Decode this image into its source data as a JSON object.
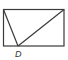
{
  "diagram": {
    "type": "geometry",
    "rectangle": {
      "x": 3.5,
      "y": 9.5,
      "width": 60.5,
      "height": 36.5
    },
    "points": {
      "top_left": {
        "x": 3.5,
        "y": 9.5
      },
      "top_right": {
        "x": 64,
        "y": 9.5
      },
      "D": {
        "x": 18,
        "y": 46
      }
    },
    "segments": [
      {
        "from": "top_left",
        "to": "D"
      },
      {
        "from": "top_right",
        "to": "D"
      }
    ],
    "labels": [
      {
        "text": "D",
        "x": 15,
        "y": 57,
        "point": "D"
      }
    ],
    "colors": {
      "stroke": "#3a3a3a",
      "label": "#333333",
      "background": "#ffffff"
    }
  }
}
